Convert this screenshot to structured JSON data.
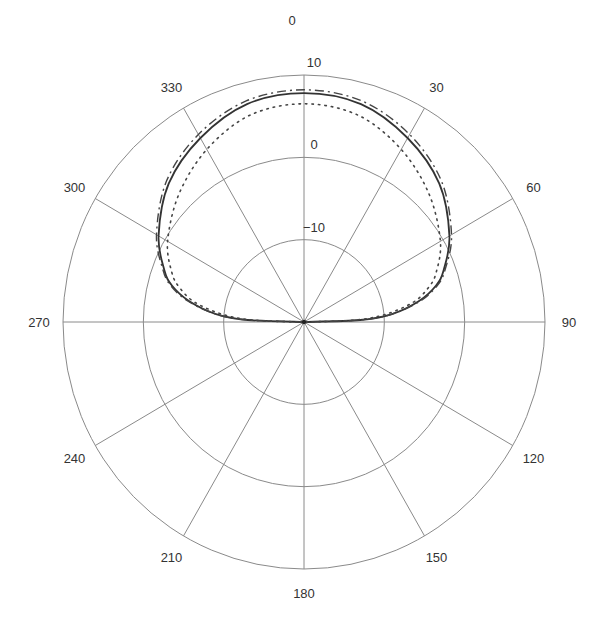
{
  "chart_data": {
    "type": "polar-line",
    "title": "",
    "center_px": [
      304,
      322
    ],
    "radius_px": [
      241,
      247
    ],
    "r_axis": {
      "min": -20,
      "max": 10,
      "ticks": [
        -10,
        0,
        10
      ],
      "tick_labels": [
        "−10",
        "0",
        "10"
      ],
      "label_angle_deg": 0
    },
    "theta_axis": {
      "direction": "clockwise",
      "zero_location": "top",
      "ticks": [
        0,
        30,
        60,
        90,
        120,
        150,
        180,
        210,
        240,
        270,
        300,
        330
      ],
      "tick_labels": [
        "0",
        "30",
        "60",
        "90",
        "120",
        "150",
        "180",
        "210",
        "240",
        "270",
        "300",
        "330"
      ]
    },
    "grid": true,
    "legend": null,
    "series": [
      {
        "name": "solid",
        "style": "solid",
        "color": "#333333",
        "theta": [
          270,
          272,
          275,
          280,
          285,
          290,
          300,
          315,
          330,
          345,
          0,
          15,
          30,
          45,
          60,
          70,
          75,
          80,
          85,
          88,
          90
        ],
        "r_db": [
          -20,
          -13,
          -9,
          -5.5,
          -3,
          -1.5,
          0.9,
          3.8,
          5.8,
          7.4,
          7.8,
          7.4,
          5.8,
          3.8,
          0.9,
          -1.5,
          -3,
          -5.5,
          -9,
          -13,
          -20
        ]
      },
      {
        "name": "dash-dot",
        "style": "dashdot",
        "color": "#444444",
        "theta": [
          270,
          272,
          275,
          280,
          285,
          290,
          300,
          315,
          330,
          345,
          0,
          15,
          30,
          45,
          60,
          70,
          75,
          80,
          85,
          88,
          90
        ],
        "r_db": [
          -20,
          -13,
          -9,
          -5.3,
          -2.8,
          -1.3,
          1.2,
          4.2,
          6.3,
          7.8,
          8.2,
          7.8,
          6.3,
          4.2,
          1.2,
          -1.3,
          -2.8,
          -5.3,
          -9,
          -13,
          -20
        ]
      },
      {
        "name": "dotted",
        "style": "dotted",
        "color": "#444444",
        "theta": [
          270,
          272,
          275,
          280,
          285,
          290,
          300,
          315,
          330,
          345,
          0,
          15,
          30,
          45,
          60,
          70,
          75,
          80,
          85,
          88,
          90
        ],
        "r_db": [
          -20,
          -14,
          -10,
          -6.2,
          -4,
          -2.5,
          -0.4,
          2.0,
          4.2,
          6.0,
          6.5,
          6.0,
          4.2,
          2.0,
          -0.4,
          -2.5,
          -4,
          -6.2,
          -10,
          -14,
          -20
        ]
      }
    ]
  }
}
